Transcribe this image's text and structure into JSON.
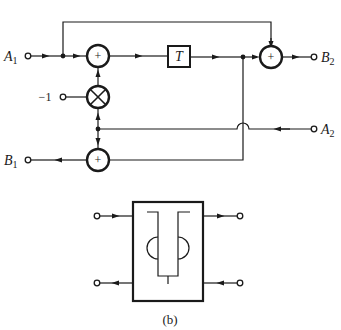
{
  "diagram": {
    "type": "signal-flow block diagram",
    "caption": "(b)",
    "ports": {
      "A1": {
        "letter": "A",
        "sub": "1"
      },
      "A2": {
        "letter": "A",
        "sub": "2"
      },
      "B1": {
        "letter": "B",
        "sub": "1"
      },
      "B2": {
        "letter": "B",
        "sub": "2"
      }
    },
    "constant_input": "−1",
    "delay_label": "T",
    "sum_symbol": "+",
    "nodes": [
      {
        "id": "sum1",
        "kind": "adder",
        "symbol": "+"
      },
      {
        "id": "mult",
        "kind": "multiplier",
        "symbol": "×"
      },
      {
        "id": "delay",
        "kind": "delay",
        "label": "T"
      },
      {
        "id": "sum2",
        "kind": "adder",
        "symbol": "+"
      },
      {
        "id": "sum3",
        "kind": "adder",
        "symbol": "+"
      }
    ],
    "edges": [
      "A1 → junction1",
      "junction1 → sum1",
      "junction1 → sum2 (top bypass)",
      "−1 → mult",
      "mult → sum1",
      "sum1 → delay",
      "delay → junction2",
      "junction2 → sum2",
      "sum2 → B2",
      "junction2 → sum3 (crosses A2 line with hop)",
      "A2 → junction3",
      "junction3 → mult",
      "junction3 → sum3",
      "sum3 → B1"
    ],
    "symbol_block": {
      "description": "two-port lattice/waveguide symbol with T-shaped delay and two half-circle arcs",
      "ports": [
        "in-top-left",
        "out-top-right",
        "out-bottom-left",
        "in-bottom-right"
      ]
    }
  }
}
